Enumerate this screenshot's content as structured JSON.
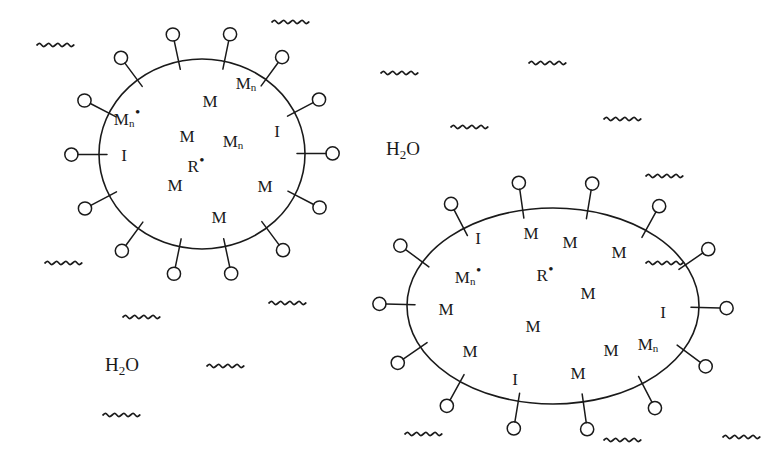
{
  "figure": {
    "background_color": "#ffffff",
    "stroke_color": "#1a1a1a",
    "text_color": "#1a1a1a"
  },
  "solvent": {
    "formula_prefix": "H",
    "formula_sub": "2",
    "formula_suffix": "O",
    "labels": [
      {
        "name": "water-label-upper-right",
        "text": "H2O",
        "x": 403,
        "y": 150
      },
      {
        "name": "water-label-lower-left",
        "text": "H2O",
        "x": 122,
        "y": 366
      }
    ]
  },
  "micelles": [
    {
      "id": "micelle-left",
      "shape": "circle",
      "cx": 202,
      "cy": 154,
      "rx": 103,
      "ry": 95,
      "surfactant_count": 14,
      "species": [
        {
          "name": "oligomer-radical",
          "base": "M",
          "sub": "n",
          "dot": true,
          "x": 127,
          "y": 117
        },
        {
          "name": "monomer",
          "base": "M",
          "sub": "",
          "dot": false,
          "x": 210,
          "y": 101
        },
        {
          "name": "oligomer",
          "base": "M",
          "sub": "n",
          "dot": false,
          "x": 246,
          "y": 84
        },
        {
          "name": "monomer",
          "base": "M",
          "sub": "",
          "dot": false,
          "x": 187,
          "y": 136
        },
        {
          "name": "oligomer",
          "base": "M",
          "sub": "n",
          "dot": false,
          "x": 233,
          "y": 142
        },
        {
          "name": "initiator",
          "base": "I",
          "sub": "",
          "dot": false,
          "x": 277,
          "y": 131
        },
        {
          "name": "initiator",
          "base": "I",
          "sub": "",
          "dot": false,
          "x": 124,
          "y": 155
        },
        {
          "name": "primary-radical",
          "base": "R",
          "sub": "",
          "dot": true,
          "x": 196,
          "y": 164
        },
        {
          "name": "monomer",
          "base": "M",
          "sub": "",
          "dot": false,
          "x": 175,
          "y": 185
        },
        {
          "name": "monomer",
          "base": "M",
          "sub": "",
          "dot": false,
          "x": 265,
          "y": 186
        },
        {
          "name": "monomer",
          "base": "M",
          "sub": "",
          "dot": false,
          "x": 219,
          "y": 217
        }
      ]
    },
    {
      "id": "micelle-right",
      "shape": "ellipse",
      "cx": 553,
      "cy": 306,
      "rx": 146,
      "ry": 98,
      "surfactant_count": 14,
      "species": [
        {
          "name": "initiator",
          "base": "I",
          "sub": "",
          "dot": false,
          "x": 478,
          "y": 238
        },
        {
          "name": "monomer",
          "base": "M",
          "sub": "",
          "dot": false,
          "x": 531,
          "y": 233
        },
        {
          "name": "monomer",
          "base": "M",
          "sub": "",
          "dot": false,
          "x": 570,
          "y": 242
        },
        {
          "name": "monomer",
          "base": "M",
          "sub": "",
          "dot": false,
          "x": 619,
          "y": 252
        },
        {
          "name": "oligomer-radical",
          "base": "M",
          "sub": "n",
          "dot": true,
          "x": 468,
          "y": 275
        },
        {
          "name": "primary-radical",
          "base": "R",
          "sub": "",
          "dot": true,
          "x": 545,
          "y": 273
        },
        {
          "name": "monomer",
          "base": "M",
          "sub": "",
          "dot": false,
          "x": 588,
          "y": 293
        },
        {
          "name": "monomer",
          "base": "M",
          "sub": "",
          "dot": false,
          "x": 446,
          "y": 309
        },
        {
          "name": "initiator",
          "base": "I",
          "sub": "",
          "dot": false,
          "x": 663,
          "y": 312
        },
        {
          "name": "monomer",
          "base": "M",
          "sub": "",
          "dot": false,
          "x": 533,
          "y": 326
        },
        {
          "name": "monomer",
          "base": "M",
          "sub": "",
          "dot": false,
          "x": 470,
          "y": 351
        },
        {
          "name": "monomer",
          "base": "M",
          "sub": "",
          "dot": false,
          "x": 611,
          "y": 350
        },
        {
          "name": "oligomer",
          "base": "M",
          "sub": "n",
          "dot": false,
          "x": 648,
          "y": 345
        },
        {
          "name": "monomer",
          "base": "M",
          "sub": "",
          "dot": false,
          "x": 578,
          "y": 373
        },
        {
          "name": "initiator",
          "base": "I",
          "sub": "",
          "dot": false,
          "x": 515,
          "y": 379
        }
      ]
    }
  ],
  "water_squiggles": [
    {
      "name": "squiggle",
      "x": 37,
      "y": 45
    },
    {
      "name": "squiggle",
      "x": 272,
      "y": 22
    },
    {
      "name": "squiggle",
      "x": 381,
      "y": 73
    },
    {
      "name": "squiggle",
      "x": 529,
      "y": 63
    },
    {
      "name": "squiggle",
      "x": 451,
      "y": 127
    },
    {
      "name": "squiggle",
      "x": 604,
      "y": 119
    },
    {
      "name": "squiggle",
      "x": 646,
      "y": 176
    },
    {
      "name": "squiggle",
      "x": 45,
      "y": 263
    },
    {
      "name": "squiggle",
      "x": 269,
      "y": 303
    },
    {
      "name": "squiggle",
      "x": 123,
      "y": 317
    },
    {
      "name": "squiggle",
      "x": 646,
      "y": 263
    },
    {
      "name": "squiggle",
      "x": 207,
      "y": 366
    },
    {
      "name": "squiggle",
      "x": 103,
      "y": 415
    },
    {
      "name": "squiggle",
      "x": 405,
      "y": 434
    },
    {
      "name": "squiggle",
      "x": 604,
      "y": 440
    },
    {
      "name": "squiggle",
      "x": 723,
      "y": 437
    }
  ]
}
